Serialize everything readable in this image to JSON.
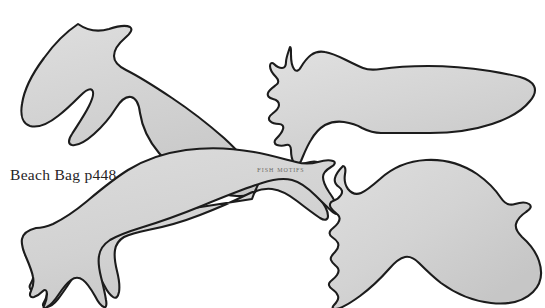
{
  "page": {
    "title": "Fish Motifs",
    "background_color": "#ffffff",
    "width": 545,
    "height": 308,
    "type": "scanned craft pattern template sheet"
  },
  "captions": {
    "beach_bag": "Beach Bag p448",
    "fish_motifs": "Fish Motifs"
  },
  "style": {
    "shape_fill": "#d4d4d4",
    "shape_fill_light": "#dcdcdc",
    "shape_fill_dark": "#c6c6c6",
    "shape_outline": "#1c1c1c",
    "outline_width": 2.1,
    "caption_color": "#26241f",
    "label_color": "#6f6d68"
  },
  "motifs": [
    {
      "name": "fish-motif-1",
      "label": "crescent-tail fish",
      "position": "top-left",
      "tail": "deep forked crescent tail pointing left",
      "body": "broad teardrop body tapering to a point at right",
      "path": "M 230 42 C 206 28 180 24 158 28 C 128 34 98 48 72 66 C 46 84 26 104 17 118 C 13 124 14 128 20 127 C 36 125 58 118 78 108 C 98 98 116 86 128 78 C 140 70 148 68 154 71 C 160 74 162 80 160 88 C 156 102 146 116 133 128 C 122 139 112 147 106 151 C 102 154 103 157 108 156 C 120 154 136 147 152 138 C 170 128 188 115 198 106 C 206 99 213 97 219 100 C 224 103 226 109 226 118 L 226 140 C 226 148 229 152 234 150 C 244 146 254 138 260 130 C 267 121 268 112 264 102 C 260 92 252 80 243 68 C 238 61 234 51 230 42 Z",
      "path_alt": "M 63 36 C 52 52 45 72 44 90 C 43 108 48 124 58 136 C 66 146 76 151 84 150 C 90 149 93 145 91 140 C 86 126 84 112 86 100 C 88 88 93 80 100 78 C 108 76 116 82 124 94 C 134 108 148 122 166 133 C 186 145 208 150 228 146 C 246 142 256 132 256 118 C 256 104 248 92 234 84 C 220 76 202 72 186 72 L 124 72 C 114 72 108 70 106 64 C 104 58 107 50 114 42 C 120 35 124 30 123 27 C 122 24 117 24 110 27 C 96 33 78 40 63 36 Z"
    },
    {
      "name": "fish-motif-2",
      "label": "scalloped-tail torpedo fish",
      "position": "top-right",
      "tail": "wavy scalloped fan tail pointing left",
      "body": "long narrow pointed-oval body"
    },
    {
      "name": "fish-motif-3",
      "label": "flared-tail fish",
      "position": "bottom-left",
      "tail": "flared notched tail pointing left",
      "body": "curved elongated body tapering to a point at right"
    },
    {
      "name": "fish-motif-4",
      "label": "classic wavy-tail fish",
      "position": "bottom-right",
      "tail": "triangular tail with wavy scalloped outer edge pointing left",
      "body": "rounded oval body with notched nose at right"
    }
  ]
}
